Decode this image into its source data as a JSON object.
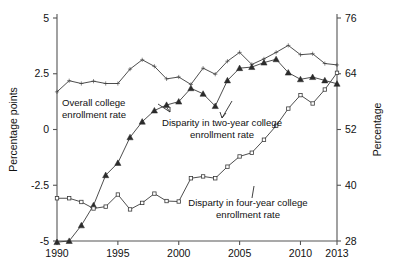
{
  "chart_data": {
    "type": "line",
    "title": "",
    "xlabel": "",
    "ylabel": "Percentage points",
    "y2label": "Percentage",
    "xlim": [
      1990,
      2013
    ],
    "ylim": [
      -5,
      5
    ],
    "y2lim": [
      28,
      76
    ],
    "grid": false,
    "legend_position": "inline-annotations",
    "xticks": [
      "1990",
      "1995",
      "2000",
      "2005",
      "2010",
      "2013"
    ],
    "xtick_values": [
      1990,
      1995,
      2000,
      2005,
      2010,
      2013
    ],
    "yticks": [
      "5",
      "2.5",
      "0",
      "-2.5",
      "-5"
    ],
    "ytick_values": [
      5,
      2.5,
      0,
      -2.5,
      -5
    ],
    "y2ticks": [
      "76",
      "64",
      "52",
      "40",
      "28"
    ],
    "y2tick_values": [
      76,
      64,
      52,
      40,
      28
    ],
    "x": [
      1990,
      1991,
      1992,
      1993,
      1994,
      1995,
      1996,
      1997,
      1998,
      1999,
      2000,
      2001,
      2002,
      2003,
      2004,
      2005,
      2006,
      2007,
      2008,
      2009,
      2010,
      2011,
      2012,
      2013
    ],
    "series": [
      {
        "name": "Overall college enrollment rate",
        "axis": "right",
        "units": "Percentage",
        "marker": "dot",
        "values": [
          60.1,
          62.5,
          61.9,
          62.4,
          61.9,
          61.9,
          65.0,
          67.0,
          65.6,
          62.9,
          63.3,
          61.7,
          65.2,
          63.9,
          66.7,
          68.6,
          66.0,
          67.2,
          68.6,
          70.1,
          68.1,
          68.3,
          66.2,
          65.9
        ],
        "values_in_points": [
          2.5,
          2.5,
          2.35,
          2.15,
          2.1,
          2.15,
          3.2,
          4.3,
          3.55,
          2.55,
          2.25,
          1.85,
          1.9,
          1.7,
          1.55,
          1.25,
          0.9,
          0.7,
          0.6,
          0.5,
          0.45,
          0.4,
          0.35,
          0.3
        ]
      },
      {
        "name": "Disparity in two-year college enrollment rate",
        "axis": "left",
        "units": "Percentage points",
        "marker": "triangle",
        "values": [
          -5.05,
          -5.0,
          -4.3,
          -3.4,
          -2.05,
          -1.5,
          -0.35,
          0.35,
          0.85,
          1.1,
          1.25,
          1.85,
          1.6,
          1.05,
          2.2,
          2.75,
          2.8,
          3.0,
          3.15,
          2.55,
          2.25,
          2.35,
          2.2,
          2.05
        ]
      },
      {
        "name": "Disparty in four-year college enrollment rate",
        "axis": "right",
        "units": "Percentage",
        "marker": "square",
        "values": [
          37.2,
          37.2,
          36.4,
          35.0,
          35.4,
          38.0,
          34.8,
          36.2,
          38.2,
          36.6,
          36.5,
          41.5,
          41.9,
          41.5,
          44.0,
          46.2,
          47.0,
          49.8,
          52.8,
          56.5,
          59.4,
          57.6,
          60.6,
          64.2
        ],
        "values_in_points": [
          -1.2,
          -1.2,
          -1.65,
          -2.4,
          -2.2,
          -3.3,
          -4.35,
          -3.6,
          -3.95,
          -3.7,
          -3.7,
          -2.65,
          -2.55,
          -2.6,
          -2.0,
          -1.6,
          -1.5,
          -1.0,
          -0.4,
          0.35,
          0.8,
          0.5,
          1.2,
          1.9
        ]
      }
    ],
    "annotations": [
      {
        "id": "annot-overall",
        "lines": [
          "Overall college",
          "enrollment rate"
        ],
        "x": 62,
        "y": 106,
        "anchor": "start"
      },
      {
        "id": "annot-two-year",
        "lines": [
          "Disparity in two-year college",
          "enrollment rate"
        ],
        "x": 222,
        "y": 126,
        "anchor": "middle"
      },
      {
        "id": "annot-four-year",
        "lines": [
          "Disparty in four-year college",
          "enrollment rate"
        ],
        "x": 248,
        "y": 206,
        "anchor": "middle"
      }
    ],
    "colors": {
      "line": "#3a3a3a",
      "marker": "#2b2b2b",
      "axis": "#555555",
      "text": "#111111",
      "background": "#ffffff"
    }
  }
}
